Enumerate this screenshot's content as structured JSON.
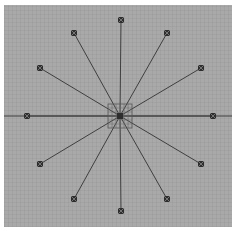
{
  "diagram": {
    "type": "radial-star",
    "center": {
      "x": 120,
      "y": 116
    },
    "colors": {
      "background": "#a9a9a9",
      "line": "#3f3f3f",
      "marker": "#2e2e2e",
      "border": "#ffffff"
    },
    "hub_grid": {
      "size": 24,
      "divisions": 6
    },
    "horizontal_axis": {
      "x1": 4,
      "x2": 232,
      "y": 116
    },
    "nodes": [
      {
        "id": "n0",
        "x": 121,
        "y": 20
      },
      {
        "id": "n1",
        "x": 167,
        "y": 33
      },
      {
        "id": "n2",
        "x": 201,
        "y": 68
      },
      {
        "id": "n3",
        "x": 213,
        "y": 116
      },
      {
        "id": "n4",
        "x": 201,
        "y": 164
      },
      {
        "id": "n5",
        "x": 167,
        "y": 199
      },
      {
        "id": "n6",
        "x": 121,
        "y": 211
      },
      {
        "id": "n7",
        "x": 74,
        "y": 199
      },
      {
        "id": "n8",
        "x": 40,
        "y": 164
      },
      {
        "id": "n9",
        "x": 27,
        "y": 116
      },
      {
        "id": "n10",
        "x": 40,
        "y": 68
      },
      {
        "id": "n11",
        "x": 74,
        "y": 33
      }
    ]
  }
}
